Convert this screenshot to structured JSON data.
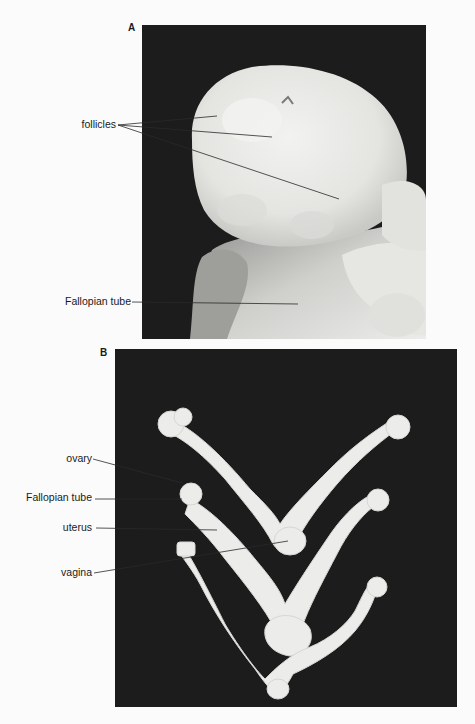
{
  "figure": {
    "panels": [
      {
        "letter": "A",
        "subject": "ovary with follicles",
        "labels": [
          {
            "text": "follicles",
            "targets": 3
          },
          {
            "text": "Fallopian tube",
            "targets": 1
          }
        ]
      },
      {
        "letter": "B",
        "subject": "reproductive tracts (ovary, Fallopian tube, uterus, vagina)",
        "labels": [
          {
            "text": "ovary",
            "targets": 1
          },
          {
            "text": "Fallopian tube",
            "targets": 1
          },
          {
            "text": "uterus",
            "targets": 1
          },
          {
            "text": "vagina",
            "targets": 1
          }
        ]
      }
    ]
  },
  "colors": {
    "page_background": "#fbfbfb",
    "photo_background": "#1c1c1c",
    "tissue": "#e9e9e6",
    "label_text": "#1a1a1a",
    "leader_line": "#2a2a2a"
  }
}
